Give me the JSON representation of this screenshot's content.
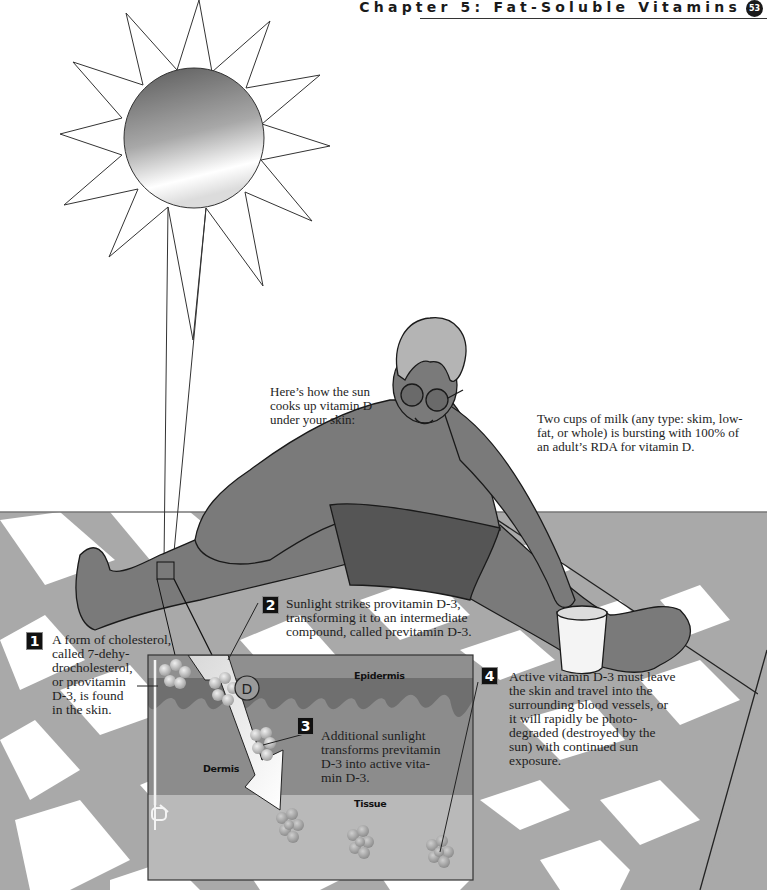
{
  "header": {
    "chapter_title": "Chapter 5: Fat-Soluble Vitamins",
    "page_number": "53"
  },
  "intro": {
    "lines": [
      "Here’s how the sun",
      "cooks up vitamin D",
      "under your skin:"
    ]
  },
  "milk_note": {
    "lines": [
      "Two cups of milk (any type: skim, low-",
      "fat, or whole) is bursting with 100% of",
      "an adult’s RDA for vitamin D."
    ]
  },
  "steps": [
    {
      "number": "1",
      "lines": [
        "A form of cholesterol,",
        "called 7-dehy-",
        "drocholesterol,",
        "or provitamin",
        "D-3, is found",
        "in the skin."
      ]
    },
    {
      "number": "2",
      "lines": [
        "Sunlight strikes provitamin D-3,",
        "transforming it to an intermediate",
        "compound, called previtamin D-3."
      ]
    },
    {
      "number": "3",
      "lines": [
        "Additional sunlight",
        "transforms previtamin",
        "D-3 into active vita-",
        "min D-3."
      ]
    },
    {
      "number": "4",
      "lines": [
        "Active vitamin D-3 must leave",
        "the skin and travel into the",
        "surrounding blood vessels, or",
        "it will rapidly be photo-",
        "degraded (destroyed by the",
        "sun) with continued sun",
        "exposure."
      ]
    }
  ],
  "diagram": {
    "layers": {
      "epidermis": "Epidermis",
      "dermis": "Dermis",
      "tissue": "Tissue"
    },
    "molecule_label": "D"
  },
  "colors": {
    "skin": "#7a7a7a",
    "shorts": "#555555",
    "hair": "#b4b4b4",
    "floor_gray": "#a8a8a8",
    "epidermis": "#6f6f6f",
    "dermis": "#8c8c8c",
    "tissue": "#b9b9b9"
  }
}
